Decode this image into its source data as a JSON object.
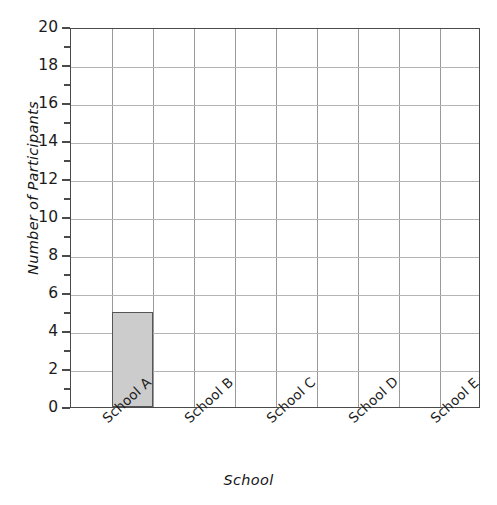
{
  "chart_data": {
    "type": "bar",
    "title": "",
    "subtitle": "",
    "xlabel": "School",
    "ylabel": "Number of Participants",
    "categories": [
      "School A",
      "School B",
      "School C",
      "School D",
      "School E"
    ],
    "values": [
      5,
      0,
      0,
      0,
      0
    ],
    "series": [
      {
        "name": "Participants",
        "values": [
          5,
          0,
          0,
          0,
          0
        ]
      }
    ],
    "ylim": [
      0,
      20
    ],
    "xlim": [
      0,
      10
    ],
    "y_major_step": 2,
    "y_minor_step": 1,
    "y_ticks": [
      0,
      2,
      4,
      6,
      8,
      10,
      12,
      14,
      16,
      18,
      20
    ],
    "y_tick_labels": [
      "0",
      "2",
      "4",
      "6",
      "8",
      "10",
      "12",
      "14",
      "16",
      "18",
      "20"
    ],
    "y_minor_ticks": [
      1,
      3,
      5,
      7,
      9,
      11,
      13,
      15,
      17,
      19
    ],
    "x_grid_columns": 10,
    "bar_column_indices": [
      1,
      3,
      5,
      7,
      9
    ],
    "grid": "on",
    "legend": "none",
    "bar_fill_color": "#cccccc",
    "bar_edge_color": "#555555",
    "grid_color": "#b4b4b4",
    "axis_color": "#4a4a4a",
    "text_color": "#1b1b1b",
    "annotations": []
  }
}
